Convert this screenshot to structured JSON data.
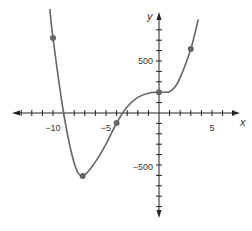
{
  "chart_data": {
    "type": "line",
    "title": "",
    "xlabel": "x",
    "ylabel": "y",
    "xlim": [
      -14,
      7.5
    ],
    "ylim": [
      -850,
      1050
    ],
    "x_tick_step": 1,
    "y_tick_step": 100,
    "x_tick_labels": [
      {
        "value": -10,
        "label": "−10"
      },
      {
        "value": -5,
        "label": "−5"
      },
      {
        "value": 5,
        "label": "5"
      }
    ],
    "y_tick_labels": [
      {
        "value": 500,
        "label": "500"
      },
      {
        "value": -500,
        "label": "−500"
      }
    ],
    "series": [
      {
        "name": "f(x)",
        "color": "#666666",
        "x": [
          -10.3,
          -10,
          -9,
          -8,
          -7.2,
          -6,
          -5,
          -4,
          -3,
          -2,
          -1,
          0,
          0.5,
          1,
          1.5,
          2,
          3,
          3.7
        ],
        "values": [
          1000,
          720,
          0,
          -480,
          -605,
          -470,
          -300,
          -96,
          60,
          150,
          190,
          200,
          200,
          205,
          250,
          340,
          615,
          900
        ]
      }
    ],
    "marked_points": [
      {
        "x": -10,
        "y": 720
      },
      {
        "x": -7.2,
        "y": -605
      },
      {
        "x": -4,
        "y": -96
      },
      {
        "x": 0,
        "y": 200
      },
      {
        "x": 3,
        "y": 615
      }
    ],
    "grid": false,
    "legend": null
  },
  "axes": {
    "x_label": "x",
    "y_label": "y",
    "x_ticks": {
      "neg10": "−10",
      "neg5": "−5",
      "pos5": "5"
    },
    "y_ticks": {
      "pos500": "500",
      "neg500": "−500"
    }
  }
}
